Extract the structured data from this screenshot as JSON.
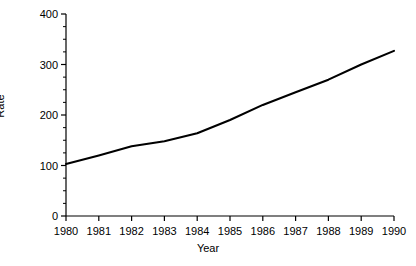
{
  "chart_data": {
    "type": "line",
    "title": "",
    "xlabel": "Year",
    "ylabel": "Rate",
    "x": [
      1980,
      1981,
      1982,
      1983,
      1984,
      1985,
      1986,
      1987,
      1988,
      1989,
      1990
    ],
    "categories": [
      "1980",
      "1981",
      "1982",
      "1983",
      "1984",
      "1985",
      "1986",
      "1987",
      "1988",
      "1989",
      "1990"
    ],
    "values": [
      103,
      120,
      138,
      148,
      164,
      190,
      220,
      245,
      270,
      300,
      327
    ],
    "series": [
      {
        "name": "Rate",
        "values": [
          103,
          120,
          138,
          148,
          164,
          190,
          220,
          245,
          270,
          300,
          327
        ]
      }
    ],
    "xlim": [
      1980,
      1990
    ],
    "ylim": [
      0,
      400
    ],
    "x_tick_labels": [
      "1980",
      "1981",
      "1982",
      "1983",
      "1984",
      "1985",
      "1986",
      "1987",
      "1988",
      "1989",
      "1990"
    ],
    "y_tick_labels": [
      "0",
      "100",
      "200",
      "300",
      "400"
    ],
    "y_ticks": [
      0,
      100,
      200,
      300,
      400
    ],
    "y_minor_tick_step": 25,
    "grid": false,
    "legend": "none",
    "line_color": "#000000",
    "axis_color": "#000000",
    "background_color": "#ffffff"
  }
}
